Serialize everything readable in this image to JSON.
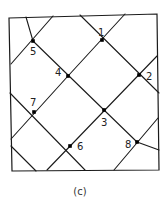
{
  "figure": {
    "caption": "(c)",
    "border": [
      [
        9,
        18
      ],
      [
        157,
        14
      ],
      [
        159,
        170
      ],
      [
        12,
        171
      ]
    ],
    "nodes": [
      {
        "id": "1",
        "label": "1",
        "x": 102,
        "y": 40,
        "lx": 98,
        "ly": 36
      },
      {
        "id": "2",
        "label": "2",
        "x": 139,
        "y": 75,
        "lx": 146,
        "ly": 80
      },
      {
        "id": "3",
        "label": "3",
        "x": 104,
        "y": 110,
        "lx": 101,
        "ly": 126
      },
      {
        "id": "4",
        "label": "4",
        "x": 68,
        "y": 76,
        "lx": 55,
        "ly": 76
      },
      {
        "id": "5",
        "label": "5",
        "x": 33,
        "y": 41,
        "lx": 30,
        "ly": 55
      },
      {
        "id": "6",
        "label": "6",
        "x": 70,
        "y": 146,
        "lx": 77,
        "ly": 150
      },
      {
        "id": "7",
        "label": "7",
        "x": 34,
        "y": 112,
        "lx": 30,
        "ly": 106
      },
      {
        "id": "8",
        "label": "8",
        "x": 137,
        "y": 142,
        "lx": 125,
        "ly": 148
      }
    ],
    "edges": [
      [
        26,
        17,
        33,
        41
      ],
      [
        53,
        16,
        11,
        64
      ],
      [
        80,
        15,
        159,
        93
      ],
      [
        125,
        14,
        68,
        76
      ],
      [
        68,
        76,
        11,
        139
      ],
      [
        33,
        41,
        104,
        110
      ],
      [
        104,
        110,
        137,
        142
      ],
      [
        137,
        142,
        159,
        150
      ],
      [
        157,
        56,
        47,
        170
      ],
      [
        10,
        93,
        85,
        170
      ],
      [
        158,
        118,
        114,
        170
      ],
      [
        11,
        146,
        36,
        171
      ]
    ]
  }
}
